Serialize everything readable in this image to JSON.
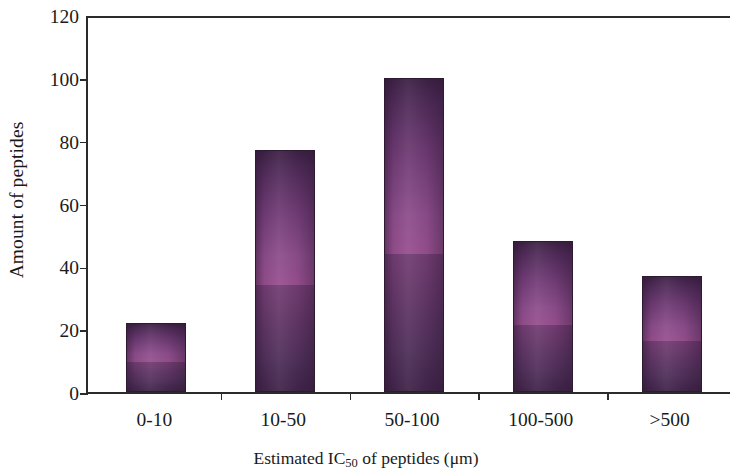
{
  "chart_data": {
    "type": "bar",
    "title": "",
    "xlabel_prefix": "Estimated IC",
    "xlabel_sub": "50",
    "xlabel_suffix": " of peptides (μm)",
    "xlabel": "Estimated IC50 of peptides (μm)",
    "ylabel": "Amount of peptides",
    "categories": [
      "0-10",
      "10-50",
      "50-100",
      "100-500",
      ">500"
    ],
    "values": [
      22,
      77,
      100,
      48,
      37
    ],
    "ylim": [
      0,
      120
    ],
    "yticks": [
      0,
      20,
      40,
      60,
      80,
      100,
      120
    ],
    "ytick_labels": [
      "0",
      "20",
      "40",
      "60",
      "80",
      "100",
      "120"
    ],
    "grid": false,
    "legend": null,
    "bar_color_dark": "#3d2145",
    "bar_color_light": "#974f8e",
    "bar_border_color": "#2e1b33",
    "axis_color": "#2b2b2b",
    "background_color": "#ffffff"
  }
}
